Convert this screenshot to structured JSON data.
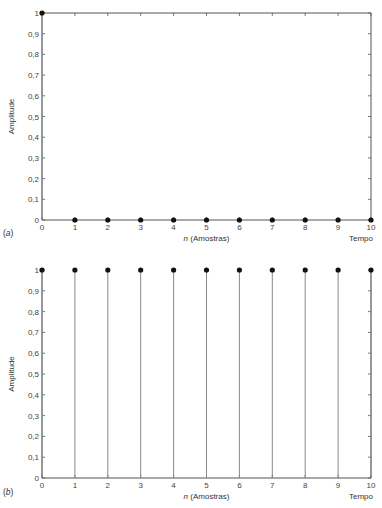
{
  "chart_data": [
    {
      "panel": "a",
      "panel_label": "(a)",
      "type": "stem",
      "title": "",
      "xlabel_italic": "n",
      "xlabel": " (Amostras)",
      "xlabel_right": "Tempo",
      "ylabel": "Amplitude",
      "xlim": [
        0,
        10
      ],
      "ylim": [
        0,
        1
      ],
      "grid": false,
      "frame": "box",
      "x_ticks": [
        "0",
        "1",
        "2",
        "3",
        "4",
        "5",
        "6",
        "7",
        "8",
        "9",
        "10"
      ],
      "y_ticks": [
        "0",
        "0,1",
        "0,2",
        "0,3",
        "0,4",
        "0,5",
        "0,6",
        "0,7",
        "0,8",
        "0,9",
        "1"
      ],
      "x": [
        0,
        1,
        2,
        3,
        4,
        5,
        6,
        7,
        8,
        9,
        10
      ],
      "values": [
        1,
        0,
        0,
        0,
        0,
        0,
        0,
        0,
        0,
        0,
        0
      ]
    },
    {
      "panel": "b",
      "panel_label": "(b)",
      "type": "stem",
      "title": "",
      "xlabel_italic": "n",
      "xlabel": " (Amostras)",
      "xlabel_right": "Tempo",
      "ylabel": "Amplitude",
      "xlim": [
        0,
        10
      ],
      "ylim": [
        0,
        1
      ],
      "grid": false,
      "frame": "open-top",
      "x_ticks": [
        "0",
        "1",
        "2",
        "3",
        "4",
        "5",
        "6",
        "7",
        "8",
        "9",
        "10"
      ],
      "y_ticks": [
        "0",
        "0,1",
        "0,2",
        "0,3",
        "0,4",
        "0,5",
        "0,6",
        "0,7",
        "0,8",
        "0,9",
        "1"
      ],
      "x": [
        0,
        1,
        2,
        3,
        4,
        5,
        6,
        7,
        8,
        9,
        10
      ],
      "values": [
        1,
        1,
        1,
        1,
        1,
        1,
        1,
        1,
        1,
        1,
        1
      ]
    }
  ],
  "colors": {
    "axis": "#555555",
    "stem": "#888888",
    "marker": "#111111",
    "text": "#333333"
  }
}
